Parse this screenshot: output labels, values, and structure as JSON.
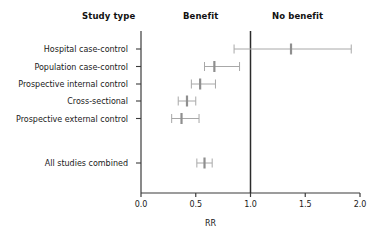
{
  "headers": {
    "study_type": "Study type",
    "benefit": "Benefit",
    "no_benefit": "No benefit"
  },
  "axis": {
    "label": "RR",
    "ticks": [
      "0.0",
      "0.5",
      "1.0",
      "1.5",
      "2.0"
    ]
  },
  "chart_data": {
    "type": "scatter",
    "subtype": "forest-plot",
    "title": "",
    "xlabel": "RR",
    "ylabel": "",
    "xlim": [
      0.0,
      2.0
    ],
    "xticks": [
      0.0,
      0.5,
      1.0,
      1.5,
      2.0
    ],
    "grid": false,
    "legend": false,
    "reference_line": 1.0,
    "region_labels": [
      {
        "text": "Benefit",
        "side": "left-of-reference"
      },
      {
        "text": "No benefit",
        "side": "right-of-reference"
      }
    ],
    "categories": [
      "Hospital case-control",
      "Population case-control",
      "Prospective internal control",
      "Cross-sectional",
      "Prospective external control",
      "All studies combined"
    ],
    "values": [
      1.37,
      0.67,
      0.54,
      0.42,
      0.37,
      0.58
    ],
    "ci_low": [
      0.85,
      0.58,
      0.46,
      0.34,
      0.28,
      0.51
    ],
    "ci_high": [
      1.92,
      0.9,
      0.68,
      0.5,
      0.53,
      0.65
    ],
    "rows": [
      {
        "label": "Hospital case-control",
        "rr": 1.37,
        "ci_low": 0.85,
        "ci_high": 1.92,
        "summary": false
      },
      {
        "label": "Population case-control",
        "rr": 0.67,
        "ci_low": 0.58,
        "ci_high": 0.9,
        "summary": false
      },
      {
        "label": "Prospective internal control",
        "rr": 0.54,
        "ci_low": 0.46,
        "ci_high": 0.68,
        "summary": false
      },
      {
        "label": "Cross-sectional",
        "rr": 0.42,
        "ci_low": 0.34,
        "ci_high": 0.5,
        "summary": false
      },
      {
        "label": "Prospective external control",
        "rr": 0.37,
        "ci_low": 0.28,
        "ci_high": 0.53,
        "summary": false
      },
      {
        "label": "All studies combined",
        "rr": 0.58,
        "ci_low": 0.51,
        "ci_high": 0.65,
        "summary": true
      }
    ]
  },
  "colors": {
    "axis": "#3b3b3b",
    "reference_line": "#2b2b2b",
    "interval": "#a8a8a8",
    "marker": "#8f8f8f",
    "text": "#1a1a1a"
  }
}
